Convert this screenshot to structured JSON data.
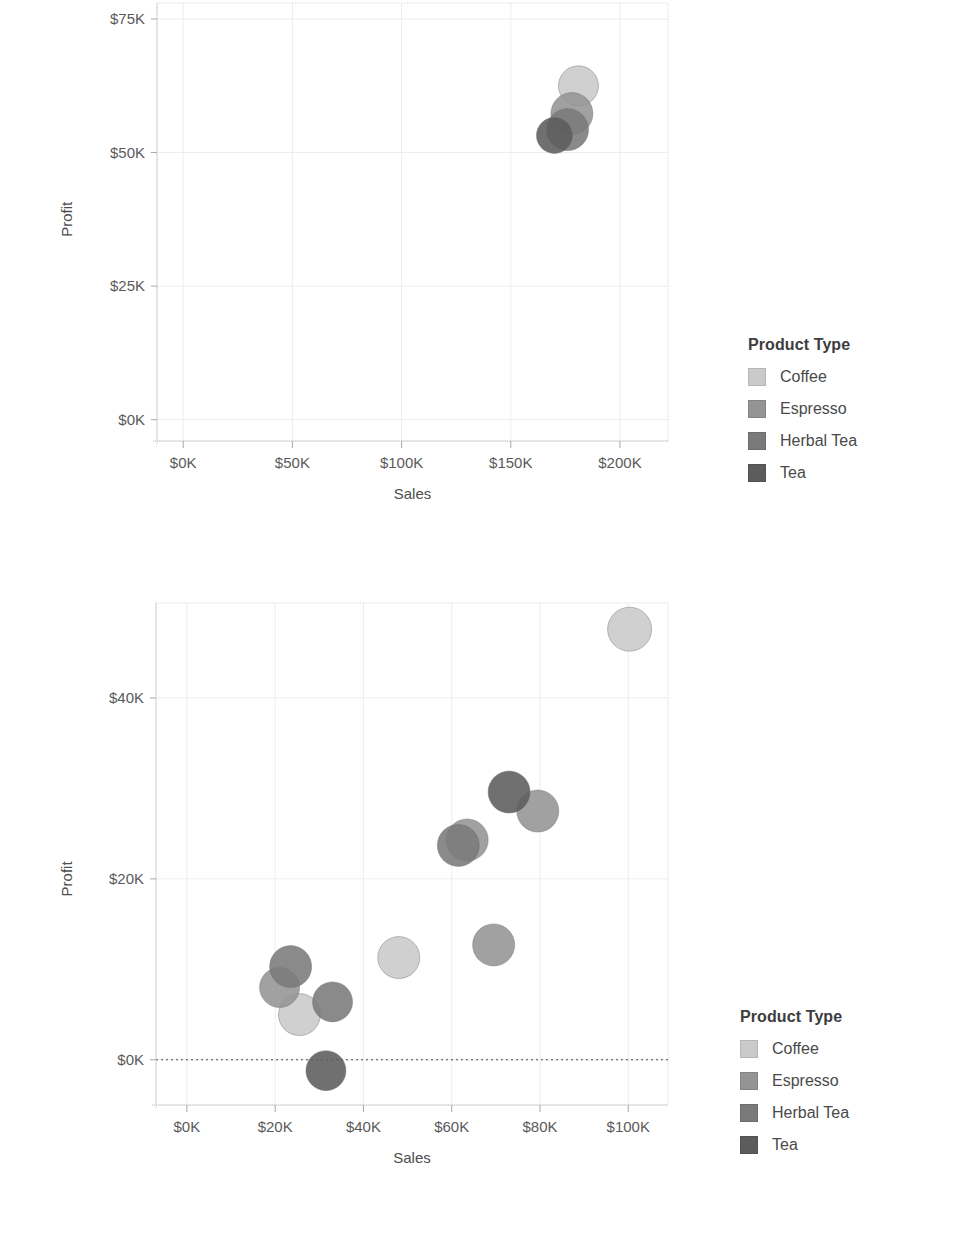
{
  "legend": {
    "title": "Product Type",
    "items": [
      {
        "label": "Coffee",
        "color": "#cacaca"
      },
      {
        "label": "Espresso",
        "color": "#949494"
      },
      {
        "label": "Herbal Tea",
        "color": "#7a7a7a"
      },
      {
        "label": "Tea",
        "color": "#5c5c5c"
      }
    ]
  },
  "chart_data": [
    {
      "id": "chart-top",
      "type": "scatter",
      "title": "",
      "xlabel": "Sales",
      "ylabel": "Profit",
      "xlim": [
        -12000,
        222000
      ],
      "ylim": [
        -4000,
        78000
      ],
      "xticks": [
        0,
        50000,
        100000,
        150000,
        200000
      ],
      "xtick_labels": [
        "$0K",
        "$50K",
        "$100K",
        "$150K",
        "$200K"
      ],
      "yticks": [
        0,
        25000,
        50000,
        75000
      ],
      "ytick_labels": [
        "$0K",
        "$25K",
        "$50K",
        "$75K"
      ],
      "grid": true,
      "zero_line": false,
      "legend_position": "right",
      "series": [
        {
          "name": "Coffee",
          "color": "#cacaca",
          "points": [
            {
              "x": 181000,
              "y": 62500,
              "r": 20
            }
          ]
        },
        {
          "name": "Espresso",
          "color": "#949494",
          "points": [
            {
              "x": 178000,
              "y": 57300,
              "r": 21
            }
          ]
        },
        {
          "name": "Herbal Tea",
          "color": "#7a7a7a",
          "points": [
            {
              "x": 176000,
              "y": 54300,
              "r": 21
            }
          ]
        },
        {
          "name": "Tea",
          "color": "#5c5c5c",
          "points": [
            {
              "x": 170000,
              "y": 53200,
              "r": 18
            }
          ]
        }
      ]
    },
    {
      "id": "chart-bottom",
      "type": "scatter",
      "title": "",
      "xlabel": "Sales",
      "ylabel": "Profit",
      "xlim": [
        -7000,
        109000
      ],
      "ylim": [
        -5000,
        50500
      ],
      "xticks": [
        0,
        20000,
        40000,
        60000,
        80000,
        100000
      ],
      "xtick_labels": [
        "$0K",
        "$20K",
        "$40K",
        "$60K",
        "$80K",
        "$100K"
      ],
      "yticks": [
        0,
        20000,
        40000
      ],
      "ytick_labels": [
        "$0K",
        "$20K",
        "$40K"
      ],
      "grid": true,
      "zero_line": true,
      "legend_position": "right",
      "series": [
        {
          "name": "Coffee",
          "color": "#cacaca",
          "points": [
            {
              "x": 100300,
              "y": 47600,
              "r": 22
            },
            {
              "x": 48000,
              "y": 11300,
              "r": 21
            },
            {
              "x": 25500,
              "y": 5000,
              "r": 21
            }
          ]
        },
        {
          "name": "Espresso",
          "color": "#949494",
          "points": [
            {
              "x": 69500,
              "y": 12700,
              "r": 21
            },
            {
              "x": 79500,
              "y": 27500,
              "r": 21
            },
            {
              "x": 63500,
              "y": 24300,
              "r": 21
            },
            {
              "x": 21000,
              "y": 8000,
              "r": 20
            }
          ]
        },
        {
          "name": "Herbal Tea",
          "color": "#7a7a7a",
          "points": [
            {
              "x": 61500,
              "y": 23700,
              "r": 21
            },
            {
              "x": 23500,
              "y": 10300,
              "r": 21
            },
            {
              "x": 33000,
              "y": 6400,
              "r": 20
            }
          ]
        },
        {
          "name": "Tea",
          "color": "#5c5c5c",
          "points": [
            {
              "x": 73000,
              "y": 29600,
              "r": 21
            },
            {
              "x": 31500,
              "y": -1200,
              "r": 20
            }
          ]
        }
      ]
    }
  ]
}
